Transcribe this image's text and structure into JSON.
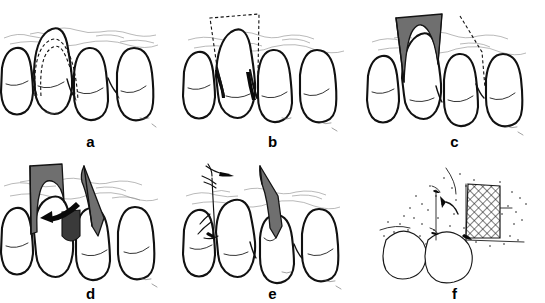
{
  "figure": {
    "background_color": "#ffffff",
    "ink_color": "#111111",
    "flap_fill_color": "#6f6f6f",
    "panel_count": 6,
    "columns": 3,
    "rows": 2
  },
  "panels": [
    {
      "id": "a",
      "label": "a",
      "caption": "Dashed incision outline traced around the interdental papilla and marginal gingiva of the tooth",
      "view": "facial",
      "teeth_visible": 4,
      "markings": [
        "dashed-incision-outline"
      ],
      "shading": "none"
    },
    {
      "id": "b",
      "label": "b",
      "caption": "Dashed rectangular flap template outlined apically over the donor site above the papilla",
      "view": "facial",
      "teeth_visible": 4,
      "markings": [
        "dashed-flap-template",
        "vertical-releasing-incisions"
      ],
      "shading": "none"
    },
    {
      "id": "c",
      "label": "c",
      "caption": "Full thickness pedicle flap elevated and reflected, shown shaded; dashed line indicates rotation path",
      "view": "facial",
      "teeth_visible": 4,
      "markings": [
        "elevated-gray-flap",
        "dashed-rotation-path"
      ],
      "shading": "gray"
    },
    {
      "id": "d",
      "label": "d",
      "caption": "Flap rotated laterally toward the recipient defect as indicated by the curved arrow",
      "view": "facial",
      "teeth_visible": 4,
      "markings": [
        "gray-donor-flap",
        "gray-rotated-flap",
        "curved-rotation-arrow",
        "recipient-defect"
      ],
      "shading": "gray"
    },
    {
      "id": "e",
      "label": "e",
      "caption": "Flap positioned over the recipient site and secured with interrupted sutures; needle and thread shown at donor site",
      "view": "facial",
      "teeth_visible": 4,
      "markings": [
        "gray-positioned-flap",
        "suture-needle",
        "suture-thread",
        "interrupted-suture"
      ],
      "shading": "gray"
    },
    {
      "id": "f",
      "label": "f",
      "caption": "Occlusal view of the stippled tissue bed with cross-hatched flap swung into the defect; arrow shows direction of rotation",
      "view": "occlusal",
      "teeth_visible": 2,
      "markings": [
        "cross-hatched-flap",
        "stippled-tissue",
        "curved-rotation-arrow",
        "suture-marks"
      ],
      "shading": "cross-hatch"
    }
  ]
}
